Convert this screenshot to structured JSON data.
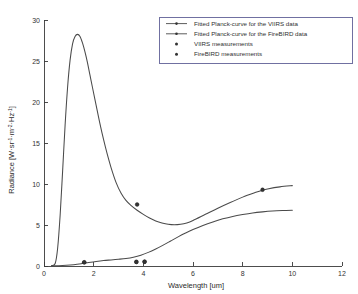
{
  "chart_data": {
    "type": "line",
    "title": "",
    "xlabel": "Wavelength [um]",
    "ylabel": "Radiance [W·sr⁻¹·m⁻²·Hz⁻¹]",
    "ylabel_parts": {
      "prefix": "Radiance [W",
      "sr": "sr",
      "sr_exp": "-1",
      "m": "m",
      "m_exp": "-2",
      "hz": "Hz",
      "hz_exp": "-1",
      "suffix": "]",
      "dot": "·"
    },
    "xlim": [
      0,
      12
    ],
    "ylim": [
      0,
      30
    ],
    "xticks": [
      0,
      2,
      4,
      6,
      8,
      10,
      12
    ],
    "yticks": [
      0,
      5,
      10,
      15,
      20,
      25,
      30
    ],
    "grid": false,
    "legend_position": "top-right",
    "legend": [
      {
        "label": "Fitted Planck-curve for the VIIRS data",
        "marker": "line"
      },
      {
        "label": "Fitted Planck-curve for the FireBIRD data",
        "marker": "line"
      },
      {
        "label": "VIIRS measurements",
        "marker": "point"
      },
      {
        "label": "FireBIRD measurements",
        "marker": "point"
      }
    ],
    "series": [
      {
        "name": "Fitted Planck-curve for the VIIRS data",
        "kind": "line",
        "color": "#4a4a4a",
        "x": [
          0.3,
          0.45,
          0.55,
          0.65,
          0.75,
          0.85,
          0.95,
          1.05,
          1.15,
          1.25,
          1.35,
          1.45,
          1.55,
          1.65,
          1.75,
          1.85,
          1.95,
          2.1,
          2.25,
          2.4,
          2.55,
          2.7,
          2.9,
          3.1,
          3.3,
          3.5,
          3.75,
          4.0,
          4.25,
          4.5,
          4.75,
          5.0,
          5.25,
          5.5,
          5.75,
          6.0,
          6.5,
          7.0,
          7.5,
          8.0,
          8.5,
          8.8,
          9.0,
          9.5,
          10.0
        ],
        "y": [
          0.05,
          0.3,
          2.2,
          6.2,
          11.6,
          17.2,
          21.8,
          25.1,
          27.1,
          28.0,
          28.25,
          28.0,
          27.2,
          26.1,
          24.8,
          23.3,
          21.8,
          19.6,
          17.4,
          15.4,
          13.6,
          12.0,
          10.2,
          8.9,
          8.0,
          7.4,
          6.8,
          6.3,
          5.85,
          5.5,
          5.25,
          5.08,
          5.02,
          5.08,
          5.25,
          5.55,
          6.3,
          7.05,
          7.75,
          8.4,
          8.95,
          9.25,
          9.4,
          9.65,
          9.8
        ]
      },
      {
        "name": "Fitted Planck-curve for the FireBIRD data",
        "kind": "line",
        "color": "#4a4a4a",
        "x": [
          0.3,
          0.6,
          0.9,
          1.2,
          1.5,
          1.8,
          2.1,
          2.4,
          2.7,
          3.0,
          3.3,
          3.6,
          3.9,
          4.2,
          4.5,
          4.8,
          5.1,
          5.4,
          5.7,
          6.0,
          6.4,
          6.8,
          7.2,
          7.6,
          8.0,
          8.4,
          8.8,
          9.2,
          9.6,
          10.0
        ],
        "y": [
          0.01,
          0.03,
          0.08,
          0.16,
          0.28,
          0.42,
          0.55,
          0.66,
          0.74,
          0.82,
          0.92,
          1.08,
          1.32,
          1.66,
          2.08,
          2.55,
          3.05,
          3.55,
          4.02,
          4.45,
          4.95,
          5.38,
          5.75,
          6.05,
          6.28,
          6.47,
          6.6,
          6.7,
          6.76,
          6.8
        ]
      },
      {
        "name": "VIIRS measurements",
        "kind": "scatter",
        "color": "#333333",
        "points": [
          {
            "x": 3.75,
            "y": 7.5
          },
          {
            "x": 8.8,
            "y": 9.3
          },
          {
            "x": 1.62,
            "y": 0.45
          },
          {
            "x": 3.72,
            "y": 0.5
          },
          {
            "x": 4.05,
            "y": 0.52
          }
        ]
      },
      {
        "name": "FireBIRD measurements",
        "kind": "scatter",
        "color": "#333333",
        "points": [
          {
            "x": 1.62,
            "y": 0.45
          },
          {
            "x": 3.72,
            "y": 0.5
          },
          {
            "x": 4.05,
            "y": 0.52
          }
        ]
      }
    ]
  }
}
